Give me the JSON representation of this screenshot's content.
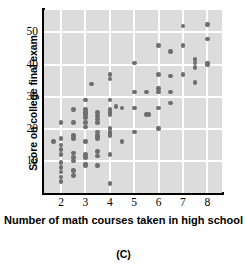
{
  "chart_data": {
    "type": "scatter",
    "title": "",
    "panel_label": "(C)",
    "xlabel": "Number of math courses taken in high school",
    "ylabel": "Score on college final exam",
    "xlim": [
      1.3,
      8.6
    ],
    "ylim": [
      0,
      57
    ],
    "xticks": [
      2,
      3,
      4,
      5,
      6,
      7,
      8
    ],
    "yticks": [
      10,
      20,
      30,
      40,
      50
    ],
    "grid": true,
    "grid_color": "#ffffff",
    "plot_background": "#dcdcdc",
    "point_color": "#6e6e6e",
    "legend": "none",
    "series": [
      {
        "name": "students",
        "points": [
          [
            1.7,
            16
          ],
          [
            2.0,
            22
          ],
          [
            2.0,
            17
          ],
          [
            2.0,
            15
          ],
          [
            2.0,
            13.5
          ],
          [
            2.0,
            12
          ],
          [
            2.0,
            9.5
          ],
          [
            2.0,
            8
          ],
          [
            2.0,
            6.5
          ],
          [
            2.0,
            5
          ],
          [
            2.0,
            3.5
          ],
          [
            2.5,
            26
          ],
          [
            2.5,
            22
          ],
          [
            2.5,
            18
          ],
          [
            2.5,
            17
          ],
          [
            2.5,
            12.5
          ],
          [
            2.5,
            11
          ],
          [
            2.5,
            10
          ],
          [
            2.5,
            7
          ],
          [
            2.5,
            5.5
          ],
          [
            3.0,
            29
          ],
          [
            3.0,
            26
          ],
          [
            3.0,
            25
          ],
          [
            3.0,
            24.5
          ],
          [
            3.0,
            23.5
          ],
          [
            3.0,
            22
          ],
          [
            3.0,
            20.5
          ],
          [
            3.0,
            16
          ],
          [
            3.0,
            12
          ],
          [
            3.0,
            11
          ],
          [
            3.0,
            9
          ],
          [
            3.0,
            8.5
          ],
          [
            3.25,
            34
          ],
          [
            3.5,
            25
          ],
          [
            3.5,
            24
          ],
          [
            3.5,
            23
          ],
          [
            3.5,
            22
          ],
          [
            3.5,
            19
          ],
          [
            3.5,
            18
          ],
          [
            3.5,
            17.5
          ],
          [
            3.5,
            17
          ],
          [
            3.5,
            13
          ],
          [
            3.5,
            11.5
          ],
          [
            3.5,
            8.5
          ],
          [
            4.0,
            37
          ],
          [
            4.0,
            35.5
          ],
          [
            4.0,
            29
          ],
          [
            4.0,
            26
          ],
          [
            4.0,
            25
          ],
          [
            4.0,
            24.5
          ],
          [
            4.0,
            20
          ],
          [
            4.0,
            19
          ],
          [
            4.0,
            18.5
          ],
          [
            4.0,
            18
          ],
          [
            4.0,
            12
          ],
          [
            4.0,
            3
          ],
          [
            4.25,
            27
          ],
          [
            4.5,
            26.5
          ],
          [
            4.5,
            16
          ],
          [
            5.0,
            40.5
          ],
          [
            5.0,
            31.5
          ],
          [
            5.0,
            26.5
          ],
          [
            5.0,
            19
          ],
          [
            5.5,
            31.5
          ],
          [
            5.5,
            24.5
          ],
          [
            5.6,
            24.5
          ],
          [
            6.0,
            46
          ],
          [
            6.0,
            37
          ],
          [
            6.0,
            32.5
          ],
          [
            6.0,
            31.5
          ],
          [
            6.0,
            26.5
          ],
          [
            6.0,
            20
          ],
          [
            6.5,
            44
          ],
          [
            6.5,
            36.5
          ],
          [
            6.5,
            31.5
          ],
          [
            6.5,
            28
          ],
          [
            7.0,
            52
          ],
          [
            7.0,
            46
          ],
          [
            7.0,
            37
          ],
          [
            7.5,
            41.5
          ],
          [
            7.5,
            40.5
          ],
          [
            7.5,
            39
          ],
          [
            7.5,
            34.5
          ],
          [
            8.0,
            52.5
          ],
          [
            8.0,
            48
          ],
          [
            8.0,
            40.5
          ],
          [
            8.0,
            40
          ]
        ]
      }
    ]
  }
}
